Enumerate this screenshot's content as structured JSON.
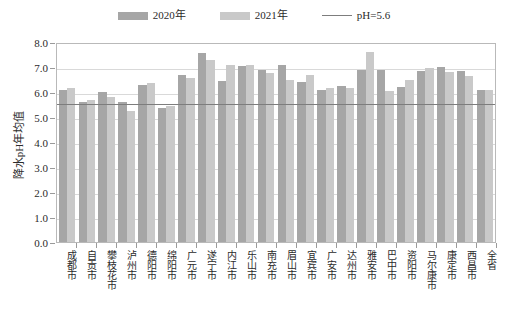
{
  "legend": {
    "items": [
      {
        "label": "2020年",
        "type": "swatch",
        "color": "#a6a6a6",
        "icon": "legend-swatch-2020"
      },
      {
        "label": "2021年",
        "type": "swatch",
        "color": "#c9c9c9",
        "icon": "legend-swatch-2021"
      },
      {
        "label": "pH=5.6",
        "type": "line",
        "color": "#7d7d7d",
        "icon": "legend-line-ph"
      }
    ]
  },
  "axes": {
    "y_title": "降水pH年均值",
    "y_ticks": [
      "8.0",
      "7.0",
      "6.0",
      "5.0",
      "4.0",
      "3.0",
      "2.0",
      "1.0",
      "0.0"
    ]
  },
  "chart_data": {
    "type": "bar",
    "title": "",
    "xlabel": "",
    "ylabel": "降水pH年均值",
    "ylim": [
      0.0,
      8.0
    ],
    "ytick_step": 1.0,
    "grid": true,
    "legend_position": "top-center",
    "categories": [
      "成都市",
      "自贡市",
      "攀枝花市",
      "泸州市",
      "德阳市",
      "绵阳市",
      "广元市",
      "遂宁市",
      "内江市",
      "乐山市",
      "南充市",
      "眉山市",
      "宜宾市",
      "广安市",
      "达州市",
      "雅安市",
      "巴中市",
      "资阳市",
      "马尔康市",
      "康定市",
      "西昌市",
      "全省"
    ],
    "series": [
      {
        "name": "2020年",
        "color": "#a6a6a6",
        "values": [
          6.1,
          5.6,
          6.0,
          5.6,
          6.3,
          5.35,
          6.7,
          7.55,
          6.45,
          7.05,
          6.9,
          7.1,
          6.4,
          6.1,
          6.25,
          6.9,
          6.9,
          6.2,
          6.85,
          7.0,
          6.85,
          6.1
        ]
      },
      {
        "name": "2021年",
        "color": "#c9c9c9",
        "values": [
          6.15,
          5.7,
          5.8,
          5.25,
          6.35,
          5.45,
          6.55,
          7.3,
          7.1,
          7.1,
          6.75,
          6.5,
          6.7,
          6.15,
          6.15,
          7.6,
          6.05,
          6.5,
          6.95,
          6.8,
          6.65,
          6.1
        ]
      }
    ],
    "reference_line": {
      "label": "pH=5.6",
      "value": 5.6,
      "color": "#7d7d7d"
    }
  }
}
